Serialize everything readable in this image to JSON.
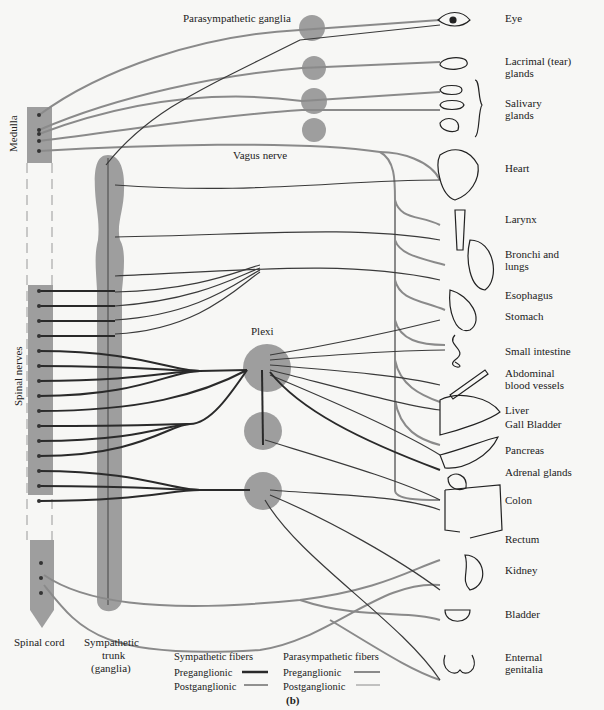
{
  "diagram": {
    "panel_label": "(b)",
    "colors": {
      "ganglion_fill": "#9e9e9e",
      "sympathetic": "#3a3a3a",
      "parasympathetic": "#8a8a8a",
      "background": "#f7f7f5"
    },
    "labels": {
      "parasympathetic_ganglia": "Parasympathetic ganglia",
      "medulla": "Medulla",
      "vagus_nerve": "Vagus nerve",
      "spinal_nerves": "Spinal nerves",
      "plexi": "Plexi",
      "spinal_cord": "Spinal cord",
      "sympathetic_trunk_1": "Sympathetic",
      "sympathetic_trunk_2": "trunk",
      "sympathetic_trunk_3": "(ganglia)"
    },
    "organs": [
      {
        "label": "Eye",
        "y": 12
      },
      {
        "label": "Lacrimal (tear)",
        "label2": "glands",
        "y": 55
      },
      {
        "label": "Salivary",
        "label2": "glands",
        "y": 97
      },
      {
        "label": "Heart",
        "y": 162
      },
      {
        "label": "Larynx",
        "y": 213
      },
      {
        "label": "Bronchi and",
        "label2": "lungs",
        "y": 248
      },
      {
        "label": "Esophagus",
        "y": 289
      },
      {
        "label": "Stomach",
        "y": 310
      },
      {
        "label": "Small intestine",
        "y": 345
      },
      {
        "label": "Abdominal",
        "label2": "blood vessels",
        "y": 367
      },
      {
        "label": "Liver",
        "y": 404
      },
      {
        "label": "Gall Bladder",
        "y": 418
      },
      {
        "label": "Pancreas",
        "y": 444
      },
      {
        "label": "Adrenal glands",
        "y": 466
      },
      {
        "label": "Colon",
        "y": 494
      },
      {
        "label": "Rectum",
        "y": 533
      },
      {
        "label": "Kidney",
        "y": 564
      },
      {
        "label": "Bladder",
        "y": 608
      },
      {
        "label": "Enternal",
        "label2": "genitalia",
        "y": 651
      }
    ],
    "legend": {
      "sympathetic_title": "Sympathetic fibers",
      "parasympathetic_title": "Parasympathetic fibers",
      "preganglionic": "Preganglionic",
      "postganglionic": "Postganglionic"
    }
  }
}
